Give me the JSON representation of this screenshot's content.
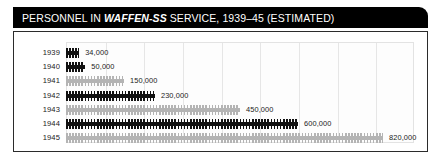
{
  "title": {
    "prefix": "PERSONNEL IN ",
    "emphasis": "WAFFEN-SS",
    "suffix": " SERVICE, 1939–45 (ESTIMATED)",
    "full": "PERSONNEL IN WAFFEN-SS SERVICE, 1939–45 (ESTIMATED)"
  },
  "colors": {
    "title_bar_background": "#000000",
    "title_text": "#ffffff",
    "panel_background": "#ffffff",
    "panel_border": "#2b2b2b",
    "gridline": "#e6e6e6",
    "bar_dark": "#111111",
    "bar_light": "#b4b4b4",
    "label_text": "#1a1a1a"
  },
  "chart_data": {
    "type": "bar",
    "orientation": "horizontal",
    "title": "PERSONNEL IN WAFFEN-SS SERVICE, 1939–45 (ESTIMATED)",
    "xlabel": "",
    "ylabel": "",
    "xlim": [
      0,
      900000
    ],
    "grid": true,
    "gridline_interval": 100000,
    "legend": null,
    "pictogram": true,
    "categories": [
      "1939",
      "1940",
      "1941",
      "1942",
      "1943",
      "1944",
      "1945"
    ],
    "values": [
      34000,
      50000,
      150000,
      230000,
      450000,
      600000,
      820000
    ],
    "value_labels": [
      "34,000",
      "50,000",
      "150,000",
      "230,000",
      "450,000",
      "600,000",
      "820,000"
    ],
    "bar_shades": [
      "dark",
      "dark",
      "light",
      "dark",
      "light",
      "dark",
      "light"
    ],
    "bars": [
      {
        "year": "1939",
        "value": 34000,
        "label": "34,000",
        "shade": "dark"
      },
      {
        "year": "1940",
        "value": 50000,
        "label": "50,000",
        "shade": "dark"
      },
      {
        "year": "1941",
        "value": 150000,
        "label": "150,000",
        "shade": "light"
      },
      {
        "year": "1942",
        "value": 230000,
        "label": "230,000",
        "shade": "dark"
      },
      {
        "year": "1943",
        "value": 450000,
        "label": "450,000",
        "shade": "light"
      },
      {
        "year": "1944",
        "value": 600000,
        "label": "600,000",
        "shade": "dark"
      },
      {
        "year": "1945",
        "value": 820000,
        "label": "820,000",
        "shade": "light"
      }
    ]
  }
}
